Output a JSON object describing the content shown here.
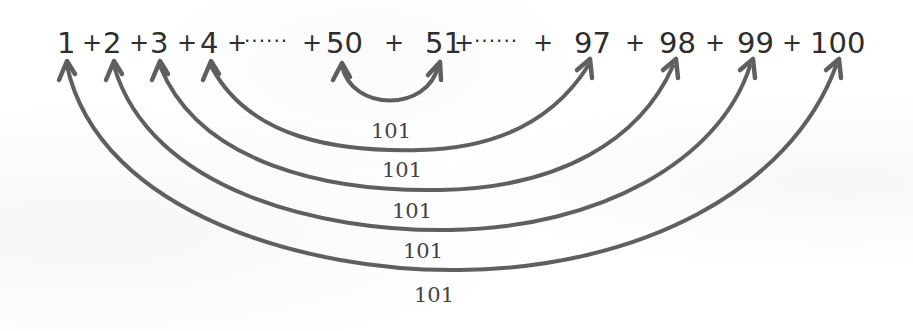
{
  "equation": {
    "terms": [
      "1",
      "2",
      "3",
      "4",
      "50",
      "51",
      "97",
      "98",
      "99",
      "100"
    ],
    "operator": "+",
    "ellipsis_left": "······",
    "ellipsis_right": "······"
  },
  "pairs": [
    {
      "left": "1",
      "right": "100",
      "sum": "101"
    },
    {
      "left": "2",
      "right": "99",
      "sum": "101"
    },
    {
      "left": "3",
      "right": "98",
      "sum": "101"
    },
    {
      "left": "4",
      "right": "97",
      "sum": "101"
    },
    {
      "left": "50",
      "right": "51",
      "sum": "101"
    }
  ],
  "colors": {
    "text": "#2e2e2e",
    "arrow": "#5f5f5f",
    "label": "#444444",
    "background": "#ffffff"
  }
}
